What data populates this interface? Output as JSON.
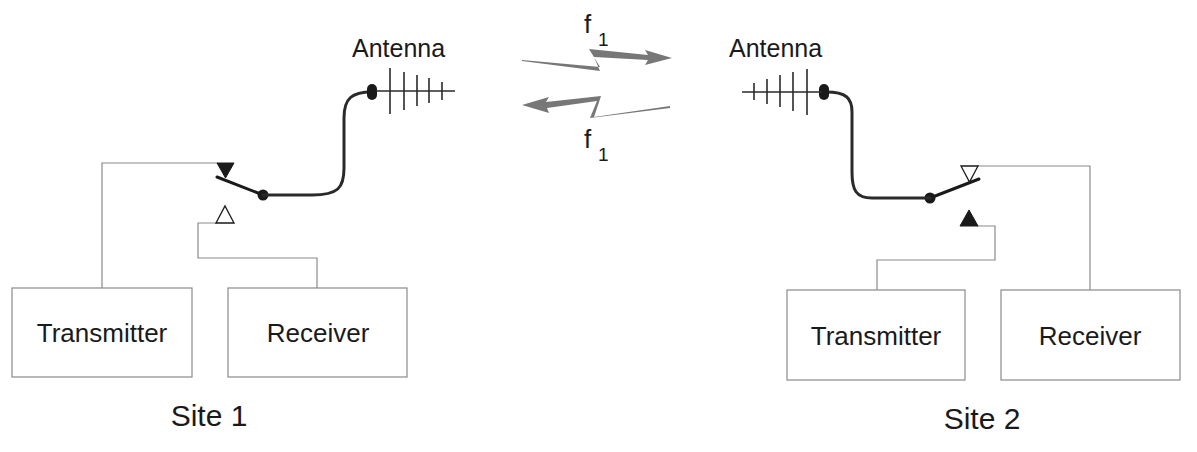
{
  "diagram": {
    "type": "half-duplex radio link (single frequency, T/R switch)",
    "colors": {
      "wire": "#8a8a8a",
      "cable": "#2a2a2a",
      "signal": "#777777",
      "text": "#1a1a1a"
    },
    "link": {
      "forward": {
        "label": "f",
        "subscript": "1",
        "direction": "site1-to-site2"
      },
      "reverse": {
        "label": "f",
        "subscript": "1",
        "direction": "site2-to-site1"
      }
    },
    "sites": [
      {
        "name": "Site 1",
        "antenna_label": "Antenna",
        "transmitter_label": "Transmitter",
        "receiver_label": "Receiver",
        "switch_position": "transmit"
      },
      {
        "name": "Site 2",
        "antenna_label": "Antenna",
        "transmitter_label": "Transmitter",
        "receiver_label": "Receiver",
        "switch_position": "receive"
      }
    ]
  }
}
